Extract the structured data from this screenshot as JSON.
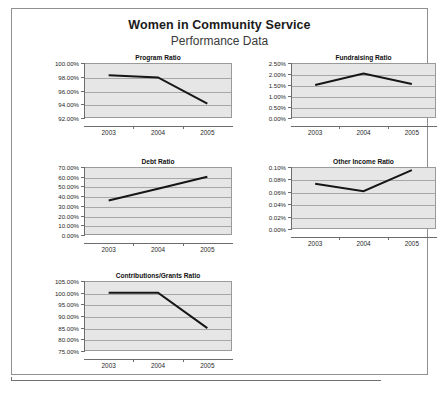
{
  "header": {
    "title": "Women in Community Service",
    "subtitle": "Performance Data"
  },
  "colors": {
    "frame_border": "#8f8f94",
    "plot_background": "#e6e6e6",
    "plot_border": "#9a9a9a",
    "gridline": "#a8a8ac",
    "axis": "#6d6d70",
    "series_line": "#161616",
    "title_text": "#1a1a1a",
    "subtitle_text": "#3a3a3a",
    "page_background": "#ffffff"
  },
  "chart_data": [
    {
      "id": "program-ratio",
      "type": "line",
      "title": "Program Ratio",
      "xlabel": "",
      "ylabel": "",
      "categories": [
        "2003",
        "2004",
        "2005"
      ],
      "values": [
        98.2,
        97.9,
        94.1
      ],
      "ylim": [
        92.0,
        100.0
      ],
      "yticks": [
        100.0,
        98.0,
        96.0,
        94.0,
        92.0
      ],
      "ytick_labels": [
        "100.00%",
        "98.00%",
        "96.00%",
        "94.00%",
        "92.00%"
      ],
      "grid": true,
      "legend": "none"
    },
    {
      "id": "fundraising-ratio",
      "type": "line",
      "title": "Fundraising Ratio",
      "xlabel": "",
      "ylabel": "",
      "categories": [
        "2003",
        "2004",
        "2005"
      ],
      "values": [
        1.5,
        2.02,
        1.55
      ],
      "ylim": [
        0.0,
        2.5
      ],
      "yticks": [
        2.5,
        2.0,
        1.5,
        1.0,
        0.5,
        0.0
      ],
      "ytick_labels": [
        "2.50%",
        "2.00%",
        "1.50%",
        "1.00%",
        "0.50%",
        "0.00%"
      ],
      "grid": true,
      "legend": "none"
    },
    {
      "id": "debt-ratio",
      "type": "line",
      "title": "Debt Ratio",
      "xlabel": "",
      "ylabel": "",
      "categories": [
        "2003",
        "2004",
        "2005"
      ],
      "values": [
        35.5,
        47.6,
        60.0
      ],
      "ylim": [
        0.0,
        70.0
      ],
      "yticks": [
        70.0,
        60.0,
        50.0,
        40.0,
        30.0,
        20.0,
        10.0,
        0.0
      ],
      "ytick_labels": [
        "70.00%",
        "60.00%",
        "50.00%",
        "40.00%",
        "30.00%",
        "20.00%",
        "10.00%",
        "0.00%"
      ],
      "grid": true,
      "legend": "none"
    },
    {
      "id": "other-income-ratio",
      "type": "line",
      "title": "Other Income Ratio",
      "xlabel": "",
      "ylabel": "",
      "categories": [
        "2003",
        "2004",
        "2005"
      ],
      "values": [
        0.073,
        0.061,
        0.095
      ],
      "ylim": [
        0.0,
        0.1
      ],
      "yticks": [
        0.1,
        0.08,
        0.06,
        0.04,
        0.02,
        0.0
      ],
      "ytick_labels": [
        "0.10%",
        "0.08%",
        "0.06%",
        "0.04%",
        "0.02%",
        "0.00%"
      ],
      "grid": true,
      "legend": "none"
    },
    {
      "id": "contributions-grants-ratio",
      "type": "line",
      "title": "Contributions/Grants Ratio",
      "xlabel": "",
      "ylabel": "",
      "categories": [
        "2003",
        "2004",
        "2005"
      ],
      "values": [
        100.0,
        100.0,
        84.8
      ],
      "ylim": [
        75.0,
        105.0
      ],
      "yticks": [
        105.0,
        100.0,
        95.0,
        90.0,
        85.0,
        80.0,
        75.0
      ],
      "ytick_labels": [
        "105.00%",
        "100.00%",
        "95.00%",
        "90.00%",
        "85.00%",
        "80.00%",
        "75.00%"
      ],
      "grid": true,
      "legend": "none"
    }
  ],
  "layout": {
    "panels": [
      {
        "chart": 0,
        "left": 24,
        "top": 44,
        "plot_left": 48,
        "plot_top": 12,
        "plot_width": 148,
        "plot_height": 55,
        "width": 200
      },
      {
        "chart": 1,
        "left": 237,
        "top": 44,
        "plot_left": 42,
        "plot_top": 12,
        "plot_width": 145,
        "plot_height": 55,
        "width": 190
      },
      {
        "chart": 2,
        "left": 24,
        "top": 148,
        "plot_left": 48,
        "plot_top": 12,
        "plot_width": 148,
        "plot_height": 68,
        "width": 200
      },
      {
        "chart": 3,
        "left": 237,
        "top": 148,
        "plot_left": 42,
        "plot_top": 12,
        "plot_width": 145,
        "plot_height": 62,
        "width": 190
      },
      {
        "chart": 4,
        "left": 24,
        "top": 262,
        "plot_left": 48,
        "plot_top": 12,
        "plot_width": 148,
        "plot_height": 70,
        "width": 200
      }
    ]
  }
}
